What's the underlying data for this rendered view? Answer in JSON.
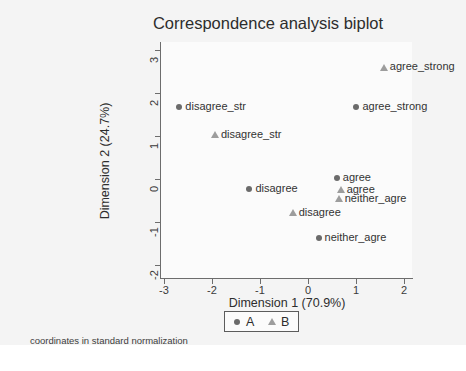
{
  "figure": {
    "title": "Correspondence analysis biplot",
    "footnote": "coordinates in standard normalization",
    "background_color": "#f4f4f4",
    "plot_background_color": "#fbfbfb"
  },
  "chart_data": {
    "type": "scatter",
    "title": "Correspondence analysis biplot",
    "subtitle": "",
    "xlabel": "Dimension 1 (70.9%)",
    "ylabel": "Dimension 2 (24.7%)",
    "xlim": [
      -3.2,
      2.2
    ],
    "ylim": [
      -2.3,
      3.2
    ],
    "xticks": [
      -3,
      -2,
      -1,
      0,
      1,
      2
    ],
    "xticklabels": [
      "-3",
      "-2",
      "-1",
      "0",
      "1",
      "2"
    ],
    "yticks": [
      3,
      2,
      1,
      0,
      -1,
      -2
    ],
    "yticklabels": [
      "3",
      "2",
      "1",
      "0",
      "-1",
      "-2"
    ],
    "grid": false,
    "legend_position": "bottom-center",
    "annotation": "coordinates in standard normalization",
    "series": [
      {
        "name": "A",
        "marker": "circle",
        "color": "#6b6b6b",
        "points": [
          {
            "label": "disagree_str",
            "x": -2.68,
            "y": 1.68
          },
          {
            "label": "agree_strong",
            "x": 1.01,
            "y": 1.67
          },
          {
            "label": "agree",
            "x": 0.6,
            "y": 0.03
          },
          {
            "label": "disagree",
            "x": -1.22,
            "y": -0.24
          },
          {
            "label": "neither_agre",
            "x": 0.22,
            "y": -1.37
          }
        ]
      },
      {
        "name": "B",
        "marker": "triangle",
        "color": "#9d9d9d",
        "points": [
          {
            "label": "agree_strong",
            "x": 1.58,
            "y": 2.6
          },
          {
            "label": "disagree_str",
            "x": -1.94,
            "y": 1.03
          },
          {
            "label": "agree",
            "x": 0.68,
            "y": -0.25
          },
          {
            "label": "neither_agre",
            "x": 0.64,
            "y": -0.46
          },
          {
            "label": "disagree",
            "x": -0.32,
            "y": -0.78
          }
        ]
      }
    ],
    "legend": [
      {
        "label": "A",
        "marker": "circle",
        "color": "#6b6b6b"
      },
      {
        "label": "B",
        "marker": "triangle",
        "color": "#9d9d9d"
      }
    ]
  }
}
